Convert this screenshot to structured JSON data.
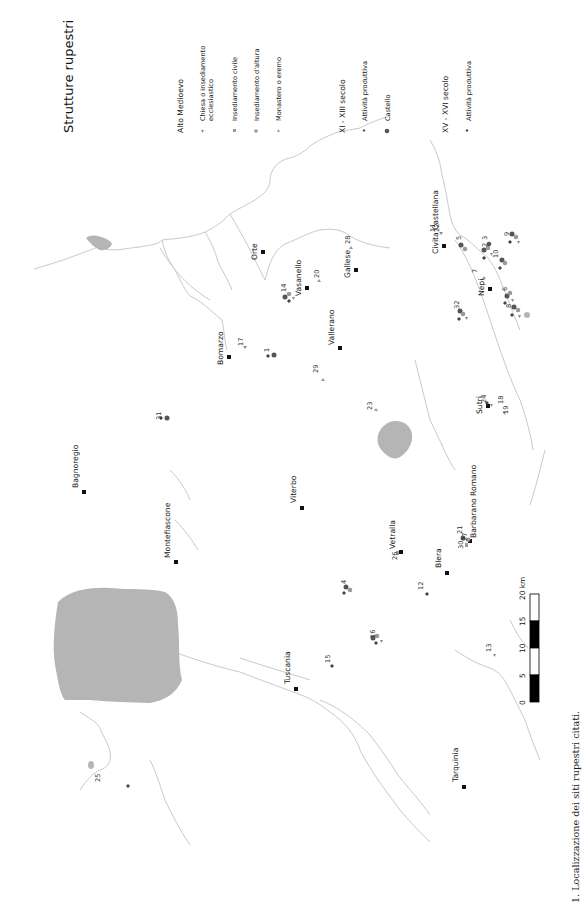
{
  "title": "Strutture rupestri",
  "caption": "1. Localizzazione dei siti rupestri citati.",
  "legend": {
    "groups": [
      {
        "heading": "Alto Medioevo",
        "items": [
          {
            "symbol": "triangle-down",
            "color": "#8a8a8a",
            "label_line1": "Chiesa o insediamento",
            "label_line2": "ecclesiastico"
          },
          {
            "symbol": "square",
            "color": "#9a9a9a",
            "label_line1": "Insediamento civile",
            "label_line2": ""
          },
          {
            "symbol": "circle",
            "color": "#9a9a9a",
            "label_line1": "Insediamento d'altura",
            "label_line2": ""
          },
          {
            "symbol": "triangle-up",
            "color": "#9a9a9a",
            "label_line1": "Monastero o eremo",
            "label_line2": ""
          }
        ]
      },
      {
        "heading": "XI - XIII secolo",
        "items": [
          {
            "symbol": "diamond",
            "color": "#555555",
            "label_line1": "Attività produttiva",
            "label_line2": ""
          },
          {
            "symbol": "circle",
            "color": "#555555",
            "label_line1": "Castello",
            "label_line2": ""
          }
        ]
      },
      {
        "heading": "XV - XVI secolo",
        "items": [
          {
            "symbol": "diamond",
            "color": "#444444",
            "label_line1": "Attività produttiva",
            "label_line2": ""
          }
        ]
      }
    ]
  },
  "towns": [
    {
      "name": "Orte",
      "x": 263,
      "y": 252
    },
    {
      "name": "Vasanello",
      "x": 307,
      "y": 288
    },
    {
      "name": "Gallese",
      "x": 356,
      "y": 270
    },
    {
      "name": "Civita Castellana",
      "x": 444,
      "y": 246
    },
    {
      "name": "Nepi",
      "x": 490,
      "y": 289
    },
    {
      "name": "Bomarzo",
      "x": 229,
      "y": 357
    },
    {
      "name": "Vallerano",
      "x": 340,
      "y": 348
    },
    {
      "name": "Sutri",
      "x": 488,
      "y": 406
    },
    {
      "name": "Bagnoregio",
      "x": 84,
      "y": 492
    },
    {
      "name": "Montefiascone",
      "x": 176,
      "y": 562
    },
    {
      "name": "Viterbo",
      "x": 302,
      "y": 508
    },
    {
      "name": "Vetralla",
      "x": 401,
      "y": 552
    },
    {
      "name": "Barbarano Romano",
      "x": 470,
      "y": 541
    },
    {
      "name": "Blera",
      "x": 447,
      "y": 573
    },
    {
      "name": "Tuscania",
      "x": 296,
      "y": 689
    },
    {
      "name": "Tarquinia",
      "x": 464,
      "y": 787
    }
  ],
  "sites": [
    {
      "num": "1",
      "label_x": 266,
      "label_y": 349
    },
    {
      "num": "2",
      "label_x": 484,
      "label_y": 244
    },
    {
      "num": "3",
      "label_x": 484,
      "label_y": 237
    },
    {
      "num": "4",
      "label_x": 344,
      "label_y": 580
    },
    {
      "num": "5",
      "label_x": 458,
      "label_y": 237
    },
    {
      "num": "6",
      "label_x": 504,
      "label_y": 288
    },
    {
      "num": "7",
      "label_x": 474,
      "label_y": 270
    },
    {
      "num": "8",
      "label_x": 508,
      "label_y": 305
    },
    {
      "num": "9",
      "label_x": 506,
      "label_y": 233
    },
    {
      "num": "10",
      "label_x": 495,
      "label_y": 252
    },
    {
      "num": "11",
      "label_x": 432,
      "label_y": 229
    },
    {
      "num": "12",
      "label_x": 420,
      "label_y": 586
    },
    {
      "num": "13",
      "label_x": 488,
      "label_y": 648
    },
    {
      "num": "14",
      "label_x": 283,
      "label_y": 287
    },
    {
      "num": "15",
      "label_x": 327,
      "label_y": 659
    },
    {
      "num": "16",
      "label_x": 372,
      "label_y": 634
    },
    {
      "num": "17",
      "label_x": 240,
      "label_y": 342
    },
    {
      "num": "18",
      "label_x": 500,
      "label_y": 400
    },
    {
      "num": "19",
      "label_x": 505,
      "label_y": 410
    },
    {
      "num": "20",
      "label_x": 316,
      "label_y": 273
    },
    {
      "num": "21",
      "label_x": 459,
      "label_y": 530
    },
    {
      "num": "22",
      "label_x": 436,
      "label_y": 226
    },
    {
      "num": "23",
      "label_x": 369,
      "label_y": 406
    },
    {
      "num": "24",
      "label_x": 483,
      "label_y": 399
    },
    {
      "num": "25",
      "label_x": 97,
      "label_y": 751
    },
    {
      "num": "26",
      "label_x": 394,
      "label_y": 556
    },
    {
      "num": "27",
      "label_x": 464,
      "label_y": 537
    },
    {
      "num": "28",
      "label_x": 347,
      "label_y": 240
    },
    {
      "num": "29",
      "label_x": 315,
      "label_y": 369
    },
    {
      "num": "30",
      "label_x": 460,
      "label_y": 545
    },
    {
      "num": "31",
      "label_x": 158,
      "label_y": 416
    },
    {
      "num": "32",
      "label_x": 456,
      "label_y": 305
    }
  ],
  "scale_bar": {
    "ticks": [
      "0",
      "5",
      "10",
      "15",
      "20 km"
    ]
  }
}
